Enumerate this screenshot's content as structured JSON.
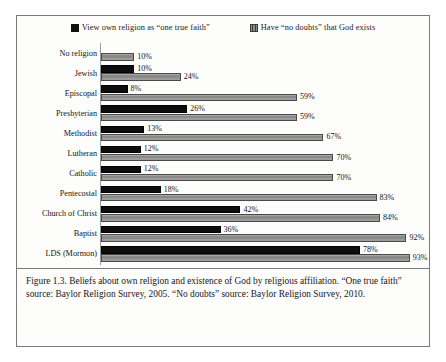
{
  "figure": {
    "caption": "Figure 1.3. Beliefs about own religion and existence of God by religious affiliation. “One true faith” source: Baylor Religion Survey, 2005. “No doubts” source: Baylor Religion Survey, 2010."
  },
  "legend": {
    "items": [
      {
        "label": "View own religion as “one true faith”",
        "swatch": "black-square-swatch",
        "color": "#101010"
      },
      {
        "label": "Have “no doubts” that God exists",
        "swatch": "gray-hatched-square-swatch",
        "color": "#8e8e8e"
      }
    ]
  },
  "chart_data": {
    "type": "bar",
    "orientation": "horizontal",
    "title": "",
    "xlabel": "",
    "ylabel": "",
    "xlim": [
      0,
      100
    ],
    "grid": false,
    "legend_position": "top-center",
    "value_label_suffix": "%",
    "categories": [
      "No religion",
      "Jewish",
      "Episcopal",
      "Presbyterian",
      "Methodist",
      "Lutheran",
      "Catholic",
      "Pentecostal",
      "Church of Christ",
      "Baptist",
      "LDS (Mormon)"
    ],
    "series": [
      {
        "name": "View own religion as “one true faith”",
        "color": "#0d0d0d",
        "values": [
          null,
          10,
          8,
          26,
          13,
          12,
          12,
          18,
          42,
          36,
          78
        ],
        "labels": [
          "",
          "10%",
          "8%",
          "26%",
          "13%",
          "12%",
          "12%",
          "18%",
          "42%",
          "36%",
          "78%"
        ]
      },
      {
        "name": "Have “no doubts” that God exists",
        "color": "#939393",
        "values": [
          10,
          24,
          59,
          59,
          67,
          70,
          70,
          83,
          84,
          92,
          93
        ],
        "labels": [
          "10%",
          "24%",
          "59%",
          "59%",
          "67%",
          "70%",
          "70%",
          "83%",
          "84%",
          "92%",
          "93%"
        ]
      }
    ]
  }
}
